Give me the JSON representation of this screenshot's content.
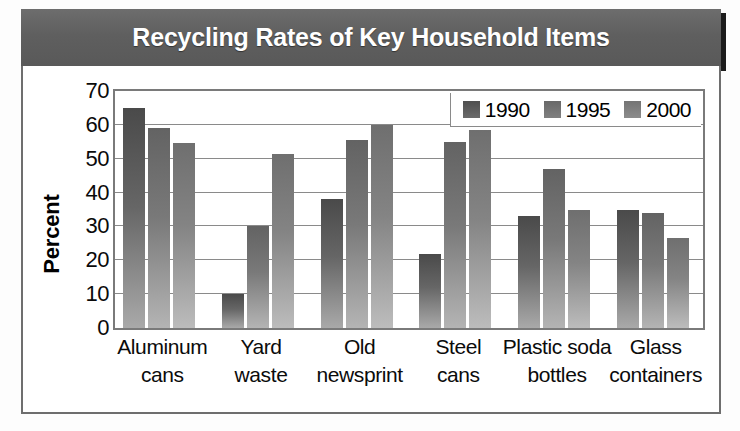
{
  "figure": {
    "title": "Recycling Rates of Key Household Items"
  },
  "legend": {
    "position": "top-right",
    "items": [
      {
        "label": "1990",
        "color": "#5a5a5a"
      },
      {
        "label": "1995",
        "color": "#757575"
      },
      {
        "label": "2000",
        "color": "#828282"
      }
    ]
  },
  "axes": {
    "ylabel": "Percent",
    "yticks": [
      "0",
      "10",
      "20",
      "30",
      "40",
      "50",
      "60",
      "70"
    ],
    "xlabel": ""
  },
  "chart_data": {
    "type": "bar",
    "title": "Recycling Rates of Key Household Items",
    "xlabel": "",
    "ylabel": "Percent",
    "ylim": [
      0,
      70
    ],
    "ytick_step": 10,
    "grid": true,
    "legend_position": "top-right",
    "categories": [
      "Aluminum cans",
      "Yard waste",
      "Old newsprint",
      "Steel cans",
      "Plastic soda bottles",
      "Glass containers"
    ],
    "category_lines": [
      [
        "Aluminum",
        "cans"
      ],
      [
        "Yard",
        "waste"
      ],
      [
        "Old",
        "newsprint"
      ],
      [
        "Steel",
        "cans"
      ],
      [
        "Plastic soda",
        "bottles"
      ],
      [
        "Glass",
        "containers"
      ]
    ],
    "series": [
      {
        "name": "1990",
        "color": "#5a5a5a",
        "values": [
          65,
          10,
          38,
          22,
          33,
          35
        ]
      },
      {
        "name": "1995",
        "color": "#757575",
        "values": [
          59,
          30,
          55.5,
          55,
          47,
          34
        ]
      },
      {
        "name": "2000",
        "color": "#828282",
        "values": [
          54.5,
          51.5,
          60,
          58.5,
          35,
          26.5
        ]
      }
    ]
  }
}
